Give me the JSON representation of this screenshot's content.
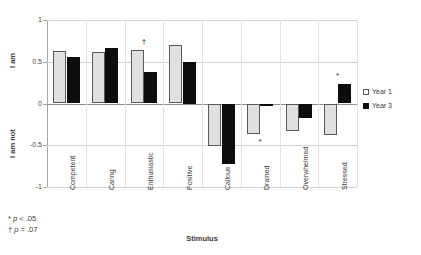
{
  "chart_data": {
    "type": "bar",
    "title": "",
    "xlabel": "Stimulus",
    "ylabel": "",
    "ylim": [
      -1,
      1
    ],
    "yticks": [
      "1",
      "0.5",
      "0",
      "-0.5",
      "-1"
    ],
    "grid": true,
    "legend_position": "right",
    "categories": [
      "Competent",
      "Caring",
      "Enthusiastic",
      "Positive",
      "Callous",
      "Drained",
      "Overwhelmed",
      "Stressed"
    ],
    "series": [
      {
        "name": "Year 1",
        "values": [
          0.63,
          0.62,
          0.64,
          0.7,
          -0.51,
          -0.36,
          -0.33,
          -0.38
        ]
      },
      {
        "name": "Year 3",
        "values": [
          0.56,
          0.66,
          0.38,
          0.5,
          -0.72,
          -0.02,
          -0.17,
          0.23
        ]
      }
    ],
    "annotations": [
      {
        "category": "Enthusiastic",
        "symbol": "†",
        "position": "above"
      },
      {
        "category": "Drained",
        "symbol": "*",
        "position": "below"
      },
      {
        "category": "Stressed",
        "symbol": "*",
        "position": "above"
      }
    ]
  },
  "axes": {
    "y_label_high": "I am",
    "y_label_low": "I am not",
    "x_title": "Stimulus"
  },
  "legend": {
    "items": [
      {
        "label": "Year 1",
        "color": "#ffffff"
      },
      {
        "label": "Year 3",
        "color": "#0d0d0d"
      }
    ]
  },
  "footnotes": [
    {
      "symbol": "*",
      "stat": "p",
      "rest": " < .05"
    },
    {
      "symbol": "†",
      "stat": "p",
      "rest": " = .07"
    }
  ],
  "colors": {
    "year1_fill": "#e0e0e0",
    "year1_border": "#595959",
    "year3_fill": "#0d0d0d",
    "gridline": "#d2d2d2",
    "zero_line": "#8f8f8f",
    "axis": "#a6a6a6"
  }
}
